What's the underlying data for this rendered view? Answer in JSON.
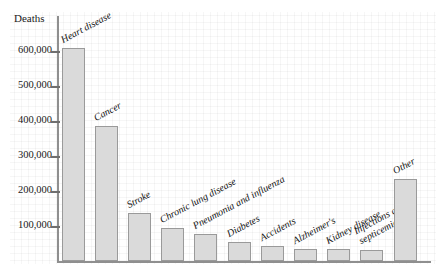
{
  "chart_data": {
    "type": "bar",
    "title": "",
    "xlabel": "",
    "ylabel": "Deaths",
    "ylim": [
      0,
      650000
    ],
    "grid": "faint background grid paper",
    "legend": "none",
    "ytick_labels": [
      "600,000",
      "500,000",
      "400,000",
      "300,000",
      "200,000",
      "100,000"
    ],
    "ytick_values": [
      600000,
      500000,
      400000,
      300000,
      200000,
      100000
    ],
    "categories": [
      "Heart disease",
      "Cancer",
      "Stroke",
      "Chronic lung disease",
      "Pneumonia and influenza",
      "Diabetes",
      "Accidents",
      "Alzheimer's",
      "Kidney disease",
      "Infections and septicemia",
      "Other"
    ],
    "values": [
      610000,
      385000,
      137000,
      95000,
      78000,
      55000,
      42000,
      35000,
      35000,
      32000,
      235000
    ]
  },
  "axis": {
    "y_title": "Deaths"
  },
  "bars": [
    {
      "label": "Heart disease",
      "value": 610000
    },
    {
      "label": "Cancer",
      "value": 385000
    },
    {
      "label": "Stroke",
      "value": 137000
    },
    {
      "label": "Chronic lung disease",
      "value": 95000
    },
    {
      "label": "Pneumonia and influenza",
      "value": 78000
    },
    {
      "label": "Diabetes",
      "value": 55000
    },
    {
      "label": "Accidents",
      "value": 42000
    },
    {
      "label": "Alzheimer's",
      "value": 35000
    },
    {
      "label": "Kidney disease",
      "value": 35000
    },
    {
      "label": "Infections and septicemia",
      "value": 32000
    },
    {
      "label": "Other",
      "value": 235000
    }
  ],
  "yticks": [
    {
      "label": "600,000",
      "value": 600000
    },
    {
      "label": "500,000",
      "value": 500000
    },
    {
      "label": "400,000",
      "value": 400000
    },
    {
      "label": "300,000",
      "value": 300000
    },
    {
      "label": "200,000",
      "value": 200000
    },
    {
      "label": "100,000",
      "value": 100000
    }
  ]
}
